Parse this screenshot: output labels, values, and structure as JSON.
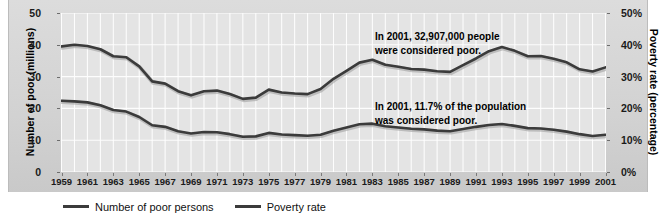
{
  "chart_data": {
    "type": "line",
    "title": "",
    "xlabel": "",
    "ylabel": "Number of poor (millions)",
    "y2label": "Poverty rate (percentage)",
    "grid": true,
    "legend_position": "bottom-left",
    "xlim": [
      1959,
      2001
    ],
    "ylim": [
      0,
      50
    ],
    "y2lim": [
      0,
      50
    ],
    "ytick_labels": [
      "0",
      "10",
      "20",
      "30",
      "40",
      "50"
    ],
    "ytick_values": [
      0,
      10,
      20,
      30,
      40,
      50
    ],
    "y2tick_labels": [
      "0%",
      "10%",
      "20%",
      "30%",
      "40%",
      "50%"
    ],
    "y2tick_values": [
      0,
      10,
      20,
      30,
      40,
      50
    ],
    "xtick_labels": [
      "1959",
      "1961",
      "1963",
      "1965",
      "1967",
      "1969",
      "1971",
      "1973",
      "1975",
      "1977",
      "1979",
      "1981",
      "1983",
      "1985",
      "1987",
      "1989",
      "1991",
      "1993",
      "1995",
      "1997",
      "1999",
      "2001"
    ],
    "x": [
      1959,
      1960,
      1961,
      1962,
      1963,
      1964,
      1965,
      1966,
      1967,
      1968,
      1969,
      1970,
      1971,
      1972,
      1973,
      1974,
      1975,
      1976,
      1977,
      1978,
      1979,
      1980,
      1981,
      1982,
      1983,
      1984,
      1985,
      1986,
      1987,
      1988,
      1989,
      1990,
      1991,
      1992,
      1993,
      1994,
      1995,
      1996,
      1997,
      1998,
      1999,
      2000,
      2001
    ],
    "series": [
      {
        "name": "Number of poor persons",
        "axis": "left",
        "units": "millions",
        "color": "#3b3b3b",
        "values": [
          39.5,
          40.0,
          39.6,
          38.6,
          36.4,
          36.1,
          33.2,
          28.5,
          27.8,
          25.4,
          24.1,
          25.4,
          25.6,
          24.5,
          23.0,
          23.4,
          25.9,
          25.0,
          24.7,
          24.5,
          26.1,
          29.3,
          31.8,
          34.4,
          35.3,
          33.7,
          33.1,
          32.4,
          32.2,
          31.7,
          31.5,
          33.6,
          35.7,
          38.0,
          39.3,
          38.1,
          36.4,
          36.5,
          35.6,
          34.5,
          32.3,
          31.6,
          32.9
        ]
      },
      {
        "name": "Poverty rate",
        "axis": "right",
        "units": "percent",
        "color": "#3b3b3b",
        "values": [
          22.4,
          22.2,
          21.9,
          21.0,
          19.5,
          19.0,
          17.3,
          14.7,
          14.2,
          12.8,
          12.1,
          12.6,
          12.5,
          11.9,
          11.1,
          11.2,
          12.3,
          11.8,
          11.6,
          11.4,
          11.7,
          13.0,
          14.0,
          15.0,
          15.2,
          14.4,
          14.0,
          13.6,
          13.4,
          13.0,
          12.8,
          13.5,
          14.2,
          14.8,
          15.1,
          14.5,
          13.8,
          13.7,
          13.3,
          12.7,
          11.9,
          11.3,
          11.7
        ]
      }
    ],
    "annotations": [
      {
        "id": "poor-count-note",
        "text": "In 2001, 32,907,000 people\nwere considered poor.",
        "x": 1988,
        "y": 44
      },
      {
        "id": "poverty-rate-note",
        "text": "In 2001, 11.7% of the population\nwas considered poor.",
        "x": 1988,
        "y": 23
      }
    ]
  },
  "legend": {
    "entries": [
      {
        "label": "Number of poor persons",
        "color": "#3b3b3b"
      },
      {
        "label": "Poverty rate",
        "color": "#3b3b3b"
      }
    ]
  },
  "colors": {
    "panel_background": "#d6d6d6",
    "plot_background": "#e4e4e4",
    "gridline": "#ffffff",
    "line": "#3b3b3b",
    "text": "#1a1a1a"
  }
}
